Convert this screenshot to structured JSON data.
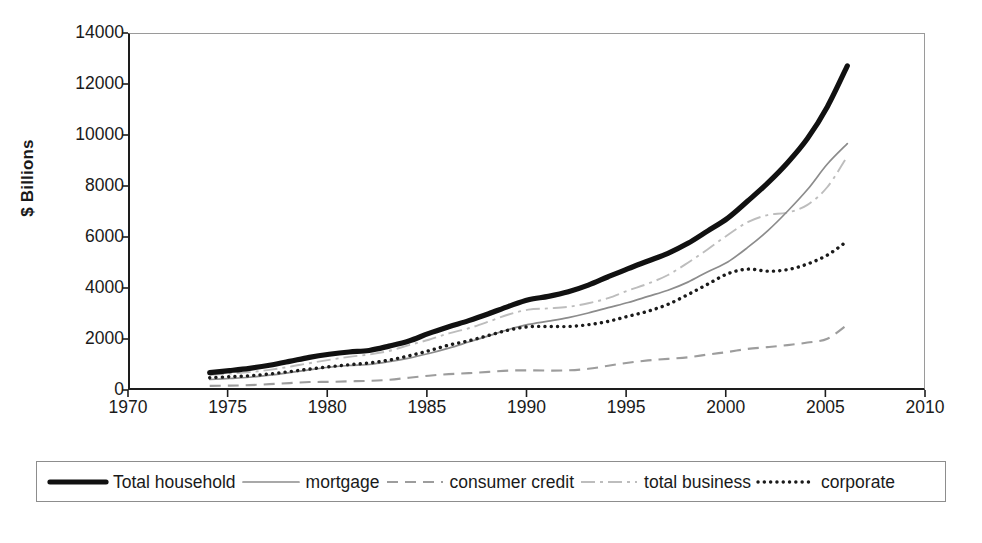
{
  "chart_data": {
    "type": "line",
    "title": "",
    "xlabel": "",
    "ylabel": "$ Billions",
    "xlim": [
      1970,
      2010
    ],
    "ylim": [
      0,
      14000
    ],
    "grid": false,
    "legend_position": "bottom",
    "x_ticks": [
      1970,
      1975,
      1980,
      1985,
      1990,
      1995,
      2000,
      2005,
      2010
    ],
    "y_ticks": [
      0,
      2000,
      4000,
      6000,
      8000,
      10000,
      12000,
      14000
    ],
    "x": [
      1974,
      1975,
      1976,
      1977,
      1978,
      1979,
      1980,
      1981,
      1982,
      1983,
      1984,
      1985,
      1986,
      1987,
      1988,
      1989,
      1990,
      1991,
      1992,
      1993,
      1994,
      1995,
      1996,
      1997,
      1998,
      1999,
      2000,
      2001,
      2002,
      2003,
      2004,
      2005,
      2006
    ],
    "series": [
      {
        "name": "Total household",
        "style": "solid-thick-black",
        "color": "#111111",
        "values": [
          720,
          800,
          890,
          1010,
          1160,
          1320,
          1440,
          1530,
          1590,
          1760,
          1960,
          2260,
          2520,
          2760,
          3030,
          3320,
          3580,
          3710,
          3890,
          4150,
          4480,
          4800,
          5100,
          5400,
          5790,
          6280,
          6780,
          7450,
          8150,
          8950,
          9900,
          11150,
          12750
        ]
      },
      {
        "name": "mortgage",
        "style": "solid-thin-gray",
        "color": "#8c8c8c",
        "values": [
          450,
          490,
          540,
          620,
          720,
          830,
          930,
          1000,
          1040,
          1150,
          1290,
          1470,
          1680,
          1920,
          2160,
          2410,
          2610,
          2740,
          2880,
          3060,
          3270,
          3470,
          3710,
          3950,
          4270,
          4680,
          5060,
          5630,
          6280,
          7050,
          7900,
          8900,
          9700
        ]
      },
      {
        "name": "consumer credit",
        "style": "dashed-gray",
        "color": "#9d9d9d",
        "values": [
          200,
          210,
          230,
          270,
          310,
          350,
          360,
          380,
          400,
          440,
          520,
          600,
          660,
          700,
          750,
          800,
          810,
          800,
          810,
          870,
          990,
          1110,
          1200,
          1260,
          1320,
          1430,
          1530,
          1650,
          1720,
          1800,
          1900,
          2050,
          2600
        ]
      },
      {
        "name": "total business",
        "style": "dashdot-light",
        "color": "#bdbdbd",
        "values": [
          630,
          680,
          740,
          830,
          950,
          1090,
          1220,
          1340,
          1430,
          1570,
          1800,
          2010,
          2260,
          2460,
          2720,
          3000,
          3190,
          3240,
          3300,
          3440,
          3640,
          3940,
          4210,
          4550,
          5030,
          5560,
          6120,
          6620,
          6900,
          7000,
          7300,
          8000,
          9200
        ]
      },
      {
        "name": "corporate",
        "style": "dotted-black",
        "color": "#1a1a1a",
        "values": [
          520,
          560,
          600,
          670,
          760,
          860,
          950,
          1030,
          1100,
          1210,
          1380,
          1580,
          1800,
          1970,
          2180,
          2390,
          2520,
          2530,
          2530,
          2600,
          2730,
          2930,
          3130,
          3400,
          3780,
          4190,
          4600,
          4780,
          4700,
          4760,
          4980,
          5330,
          5880
        ]
      }
    ]
  },
  "axes": {
    "y_title": "$ Billions",
    "y_tick_labels": [
      "14000",
      "12000",
      "10000",
      "8000",
      "6000",
      "4000",
      "2000",
      "0"
    ],
    "x_tick_labels": [
      "1970",
      "1975",
      "1980",
      "1985",
      "1990",
      "1995",
      "2000",
      "2005",
      "2010"
    ]
  },
  "legend": {
    "entries": [
      {
        "label": "Total household",
        "key": "solid-thick-black"
      },
      {
        "label": "mortgage",
        "key": "solid-thin-gray"
      },
      {
        "label": "consumer credit",
        "key": "dashed-gray"
      },
      {
        "label": "total business",
        "key": "dashdot-light"
      },
      {
        "label": "corporate",
        "key": "dotted-black"
      }
    ]
  }
}
